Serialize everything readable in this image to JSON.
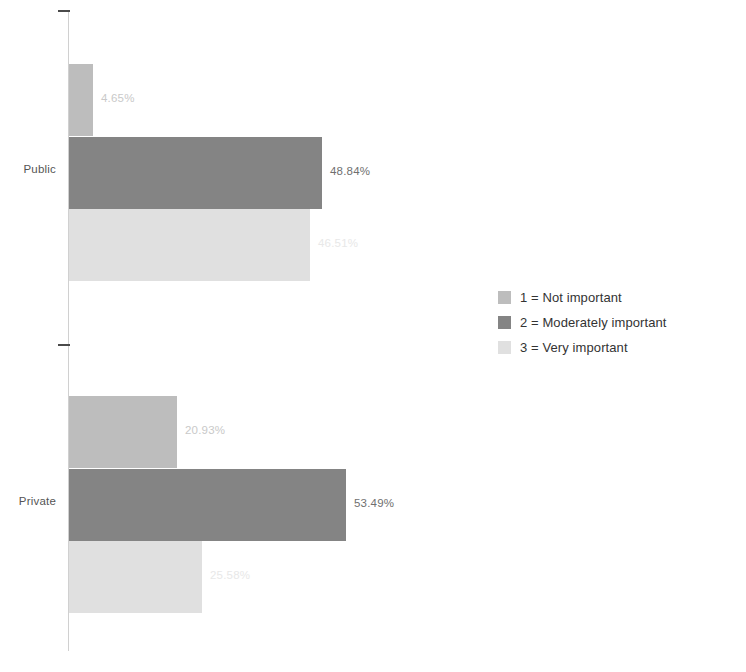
{
  "chart_data": {
    "type": "bar",
    "orientation": "horizontal",
    "title": "",
    "subtitle": "",
    "xlabel": "",
    "ylabel": "",
    "grid": false,
    "xlim": [
      0,
      60
    ],
    "legend_position": "right",
    "categories": [
      "Public",
      "Private"
    ],
    "series": [
      {
        "name": "1 = Not important",
        "key": "1",
        "color": "#bdbdbd",
        "values": [
          4.65,
          20.93
        ],
        "labels": [
          "4.65%",
          "20.93%"
        ],
        "label_color": "#c9c9c9"
      },
      {
        "name": "2 = Moderately important",
        "key": "2",
        "color": "#848484",
        "values": [
          48.84,
          53.49
        ],
        "labels": [
          "48.84%",
          "53.49%"
        ],
        "label_color": "#6f6f6f"
      },
      {
        "name": "3 = Very important",
        "key": "3",
        "color": "#e0e0e0",
        "values": [
          46.51,
          25.58
        ],
        "labels": [
          "46.51%",
          "25.58%"
        ],
        "label_color": "#e8e8e8"
      }
    ]
  },
  "legend": {
    "items": [
      {
        "label": "1 = Not important",
        "color": "#bdbdbd"
      },
      {
        "label": "2 = Moderately important",
        "color": "#848484"
      },
      {
        "label": "3 = Very important",
        "color": "#e0e0e0"
      }
    ]
  },
  "axis": {
    "category_labels": [
      "Public",
      "Private"
    ]
  }
}
